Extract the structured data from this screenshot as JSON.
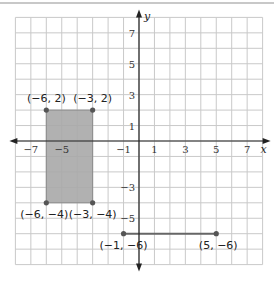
{
  "figure": {
    "axes": {
      "x_label": "x",
      "y_label": "y",
      "x_range": [
        -8,
        8
      ],
      "y_range": [
        -8,
        8
      ],
      "x_ticks": [
        "-7",
        "-5",
        "-1",
        "1",
        "3",
        "5",
        "7"
      ],
      "y_ticks": [
        "7",
        "5",
        "3",
        "1",
        "-3",
        "-5"
      ]
    },
    "rectangle": {
      "fill": "#a9a9a9",
      "vertices": [
        {
          "label": "(−6, 2)",
          "x": -6,
          "y": 2
        },
        {
          "label": "(−3, 2)",
          "x": -3,
          "y": 2
        },
        {
          "label": "(−3, −4)",
          "x": -3,
          "y": -4
        },
        {
          "label": "(−6, −4)",
          "x": -6,
          "y": -4
        }
      ]
    },
    "segment": {
      "endpoints": [
        {
          "label": "(−1, −6)",
          "x": -1,
          "y": -6
        },
        {
          "label": "(5, −6)",
          "x": 5,
          "y": -6
        }
      ]
    },
    "colors": {
      "grid": "#c9c9c9",
      "axis": "#222222",
      "point": "#555555",
      "segment": "#666666"
    }
  }
}
